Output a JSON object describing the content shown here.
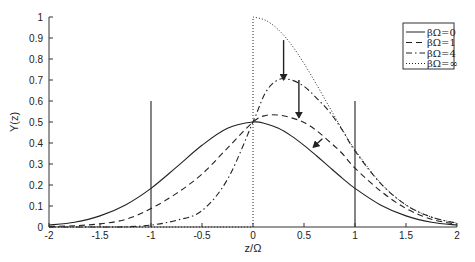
{
  "chart_data": {
    "type": "line",
    "title": "",
    "xlabel": "z/Ω",
    "ylabel": "Y(z)",
    "xlim": [
      -2,
      2
    ],
    "ylim": [
      0,
      1
    ],
    "xticks": [
      -2,
      -1.5,
      -1,
      -0.5,
      0,
      0.5,
      1,
      1.5,
      2
    ],
    "xtick_labels": [
      "-2",
      "-1.5",
      "-1",
      "-0.5",
      "0",
      "0.5",
      "1",
      "1.5",
      "2"
    ],
    "yticks": [
      0,
      0.1,
      0.2,
      0.3,
      0.4,
      0.5,
      0.6,
      0.7,
      0.8,
      0.9,
      1
    ],
    "ytick_labels": [
      "0",
      "0.1",
      "0.2",
      "0.3",
      "0.4",
      "0.5",
      "0.6",
      "0.7",
      "0.8",
      "0.9",
      "1"
    ],
    "grid": false,
    "legend_position": "upper right",
    "x": [
      -2,
      -1.75,
      -1.5,
      -1.25,
      -1,
      -0.75,
      -0.5,
      -0.25,
      0,
      0.125,
      0.25,
      0.375,
      0.5,
      0.625,
      0.75,
      0.875,
      1,
      1.25,
      1.5,
      1.75,
      2
    ],
    "series": [
      {
        "name": "βΩ=0",
        "style": "solid",
        "values": [
          0.009,
          0.023,
          0.053,
          0.105,
          0.184,
          0.285,
          0.389,
          0.47,
          0.5,
          0.492,
          0.47,
          0.434,
          0.389,
          0.338,
          0.285,
          0.233,
          0.184,
          0.105,
          0.053,
          0.023,
          0.009
        ]
      },
      {
        "name": "βΩ=1",
        "style": "dashed",
        "values": [
          0.002,
          0.006,
          0.015,
          0.036,
          0.088,
          0.16,
          0.252,
          0.376,
          0.5,
          0.531,
          0.533,
          0.52,
          0.498,
          0.458,
          0.406,
          0.35,
          0.28,
          0.172,
          0.088,
          0.037,
          0.013
        ]
      },
      {
        "name": "βΩ=4",
        "style": "dashdot",
        "values": [
          0.0,
          0.0,
          0.0,
          0.001,
          0.009,
          0.032,
          0.078,
          0.227,
          0.5,
          0.642,
          0.702,
          0.7,
          0.67,
          0.613,
          0.548,
          0.462,
          0.362,
          0.208,
          0.105,
          0.047,
          0.018
        ]
      },
      {
        "name": "βΩ=∞",
        "style": "dotted",
        "values": [
          0,
          0,
          0,
          0,
          0,
          0,
          0,
          0,
          1.0,
          0.984,
          0.939,
          0.869,
          0.779,
          0.677,
          0.57,
          0.465,
          0.368,
          0.21,
          0.105,
          0.047,
          0.018
        ]
      }
    ],
    "vertical_lines": [
      {
        "x": -1,
        "y_top": 0.6
      },
      {
        "x": 1,
        "y_top": 0.6
      }
    ],
    "annotations": [
      {
        "type": "arrow",
        "x": 0.3,
        "y_from": 0.89,
        "y_to": 0.7
      },
      {
        "type": "arrow",
        "x": 0.45,
        "y_from": 0.7,
        "y_to": 0.52
      },
      {
        "type": "arrow",
        "from": [
          0.68,
          0.42
        ],
        "to": [
          0.59,
          0.38
        ]
      }
    ]
  },
  "legend": {
    "items": [
      {
        "label": "βΩ=0",
        "style": "solid"
      },
      {
        "label": "βΩ=1",
        "style": "dashed"
      },
      {
        "label": "βΩ=4",
        "style": "dashdot"
      },
      {
        "label": "βΩ=∞",
        "style": "dotted"
      }
    ]
  }
}
